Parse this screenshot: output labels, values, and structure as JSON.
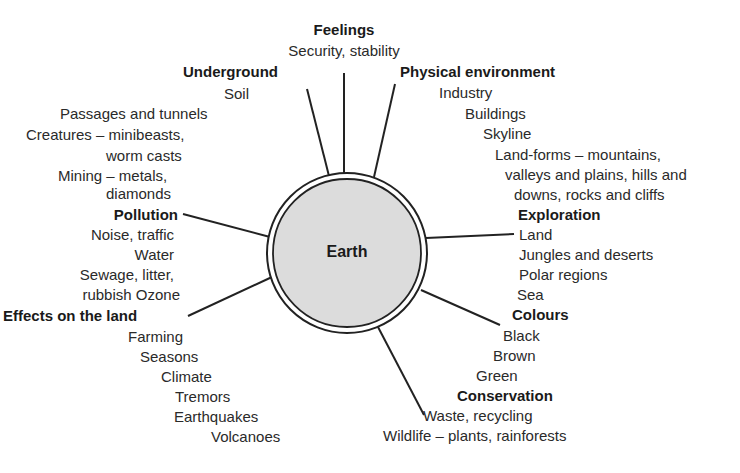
{
  "diagram": {
    "center": {
      "label": "Earth",
      "fill": "#dcdcdc",
      "stroke": "#333333"
    },
    "branches": {
      "feelings": {
        "heading": "Feelings",
        "items": [
          "Security, stability"
        ]
      },
      "underground": {
        "heading": "Underground",
        "items": [
          "Soil",
          "Passages and tunnels",
          "Creatures – minibeasts,",
          "worm casts",
          "Mining – metals,",
          "diamonds"
        ]
      },
      "physical": {
        "heading": "Physical environment",
        "items": [
          "Industry",
          "Buildings",
          "Skyline",
          "Land-forms – mountains,",
          "valleys and plains, hills and",
          "downs, rocks and cliffs"
        ]
      },
      "pollution": {
        "heading": "Pollution",
        "items": [
          "Noise, traffic",
          "Water",
          "Sewage, litter,",
          "rubbish Ozone"
        ]
      },
      "exploration": {
        "heading": "Exploration",
        "items": [
          "Land",
          "Jungles and deserts",
          "Polar regions",
          "Sea"
        ]
      },
      "effects": {
        "heading": "Effects on the land",
        "items": [
          "Farming",
          "Seasons",
          "Climate",
          "Tremors",
          "Earthquakes",
          "Volcanoes"
        ]
      },
      "colours": {
        "heading": "Colours",
        "items": [
          "Black",
          "Brown",
          "Green"
        ]
      },
      "conservation": {
        "heading": "Conservation",
        "items": [
          "Waste, recycling",
          "Wildlife – plants, rainforests"
        ]
      }
    },
    "line_color": "#222222"
  }
}
